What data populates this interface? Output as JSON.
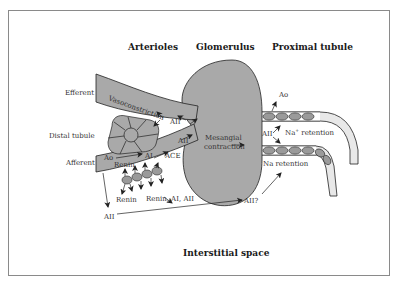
{
  "figure": {
    "headers": {
      "arterioles": "Arterioles",
      "glomerulus": "Glomerulus",
      "proximal_tubule": "Proximal tubule",
      "interstitial_space": "Interstitial space"
    },
    "structure_labels": {
      "efferent": "Efferent",
      "distal_tubule": "Distal tubule",
      "afferent": "Afferent"
    },
    "process_labels": {
      "vasoconstriction": "Vasoconstriction",
      "aii_efferent": "AII",
      "aii_afferent_tip": "AII",
      "mesangial_line1": "Mesangial",
      "mesangial_line2": "contraction",
      "ao_afferent": "Ao",
      "renin_afferent": "Renin",
      "ai_afferent": "AI",
      "ace": "ACE",
      "renin_released": "Renin",
      "renin_ai_aii": "Renin, AI, AII",
      "aii_interstitial": "AII",
      "aii_question": "AII?",
      "ao_tubule": "Ao",
      "aii_tubule": "AII",
      "na_plus_retention": "Na",
      "na_plus_sup": "+",
      "na_plus_retention_suffix": " retention",
      "na_retention": "Na retention"
    },
    "colors": {
      "tissue_gray": "#a9a9a9",
      "cell_gray": "#9a9a9a",
      "tubule_lumen": "#e8e8e8",
      "outline": "#222222",
      "frame": "#8a8a8a"
    }
  }
}
